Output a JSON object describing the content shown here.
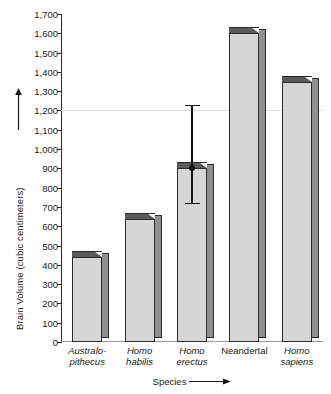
{
  "chart_data": {
    "type": "bar",
    "title": "",
    "xlabel": "Species",
    "ylabel": "Brain Volume (cubic centimeters)",
    "categories": [
      "Australo-pithecus",
      "Homo habilis",
      "Homo erectus",
      "Neandertal",
      "Homo sapiens"
    ],
    "category_lines": [
      [
        "Australo-",
        "pithecus"
      ],
      [
        "Homo",
        "habilis"
      ],
      [
        "Homo",
        "erectus"
      ],
      [
        "Neandertal",
        ""
      ],
      [
        "Homo",
        "sapiens"
      ]
    ],
    "category_italic": [
      true,
      true,
      true,
      false,
      true
    ],
    "values": [
      440,
      640,
      900,
      1600,
      1350
    ],
    "ylim": [
      0,
      1700
    ],
    "ytick_labels": [
      "0",
      "100",
      "200",
      "300",
      "400",
      "500",
      "600",
      "700",
      "800",
      "900",
      "1,000",
      "1,100",
      "1,200",
      "1,300",
      "1,400",
      "1,500",
      "1,600",
      "1,700"
    ],
    "ytick_values": [
      0,
      100,
      200,
      300,
      400,
      500,
      600,
      700,
      800,
      900,
      1000,
      1100,
      1200,
      1300,
      1400,
      1500,
      1600,
      1700
    ],
    "grid": true,
    "gridlines": [
      1200
    ],
    "legend": "none",
    "error_bars": [
      {
        "category": "Homo erectus",
        "value": 900,
        "low": 720,
        "high": 1230
      }
    ],
    "axis_arrows": {
      "y": "up",
      "x": "right"
    },
    "bar_style": "3d-block",
    "colors": {
      "bar_face": "#d6d6d6",
      "bar_side": "#8f8f8f",
      "bar_top": "#5a5a5a",
      "bar_outline": "#2b2b2b",
      "axis": "#2b2b2b",
      "gridline": "#dcdcdc",
      "error_bar": "#141414",
      "text": "#1a1a1a",
      "background": "#ffffff"
    }
  },
  "axis": {
    "y_title": "Brain Volume (cubic centimeters)",
    "x_title": "Species"
  }
}
